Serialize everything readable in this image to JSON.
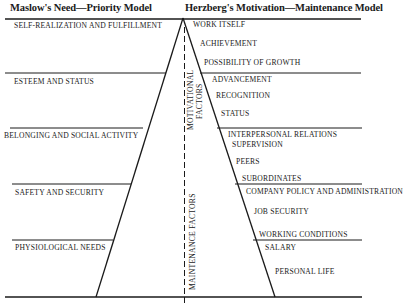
{
  "diagram": {
    "left_title": "Maslow's Need—Priority Model",
    "right_title": "Herzberg's Motivation—Maintenance Model",
    "maslow_levels": [
      "SELF-REALIZATION AND FULFILLMENT",
      "ESTEEM AND STATUS",
      "BELONGING AND SOCIAL ACTIVITY",
      "SAFETY AND SECURITY",
      "PHYSIOLOGICAL NEEDS"
    ],
    "herzberg_factors": [
      "WORK ITSELF",
      "ACHIEVEMENT",
      "POSSIBILITY OF GROWTH",
      "ADVANCEMENT",
      "RECOGNITION",
      "STATUS",
      "INTERPERSONAL RELATIONS",
      "SUPERVISION",
      "PEERS",
      "SUBORDINATES",
      "COMPANY POLICY AND ADMINISTRATION",
      "JOB SECURITY",
      "WORKING CONDITIONS",
      "SALARY",
      "PERSONAL LIFE"
    ],
    "axis_labels": {
      "motivational": [
        "MOTIVATIONAL",
        "FACTORS"
      ],
      "maintenance": "MAINTENANCE FACTORS"
    }
  }
}
